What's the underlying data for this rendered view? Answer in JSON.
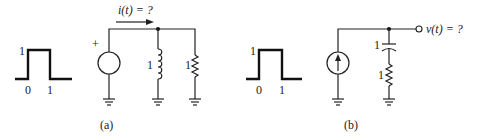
{
  "figure_a": {
    "caption": "(a)",
    "pulse": {
      "amplitude_label": "1",
      "start_label": "0",
      "end_label": "1"
    },
    "source": {
      "type": "voltage-source",
      "polarity_label": "+"
    },
    "current_label": "i(t) = ?",
    "inductor": {
      "value_label": "1"
    },
    "resistor": {
      "value_label": "1"
    }
  },
  "figure_b": {
    "caption": "(b)",
    "pulse": {
      "amplitude_label": "1",
      "start_label": "0",
      "end_label": "1"
    },
    "source": {
      "type": "current-source"
    },
    "capacitor": {
      "value_label": "1"
    },
    "resistor": {
      "value_label": "1"
    },
    "output_label": "v(t) = ?"
  }
}
